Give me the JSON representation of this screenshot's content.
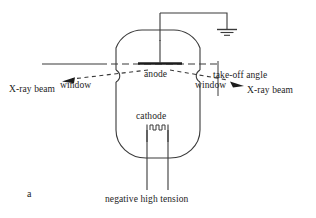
{
  "figure": {
    "panel_label": "a",
    "line_color": "#333333",
    "text_color": "#1d1d1d",
    "background": "#ffffff"
  },
  "labels": {
    "xray_beam_left": "X-ray beam",
    "window_left": "window",
    "anode": "anode",
    "takeoff_angle": "take-off angle",
    "window_right": "window",
    "xray_beam_right": "X-ray beam",
    "cathode": "cathode",
    "negative_high_tension": "negative high tension"
  },
  "components": {
    "ground_symbol": "ground-icon",
    "filament_coil": "filament-coil-icon",
    "anode_target": "anode-bar",
    "tube_envelope": "vacuum-tube-outline",
    "beam_arrow_left": "arrow-left-icon",
    "beam_arrow_right": "arrow-right-icon",
    "axis_line": "horizontal-reference-axis"
  }
}
